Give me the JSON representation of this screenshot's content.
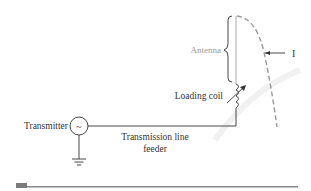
{
  "diagram": {
    "labels": {
      "antenna": "Antenna",
      "current": "I",
      "loading_coil": "Loading coil",
      "transmitter": "Transmitter",
      "transmission_line_1": "Transmission line",
      "transmission_line_2": "feeder",
      "source_symbol": "~"
    },
    "colors": {
      "line": "#333333",
      "antenna_label": "#999999",
      "antenna_wire": "#aaaaaa",
      "current_curve": "#999999",
      "bottom_bar": "#888888",
      "bottom_block": "#7a7a7a"
    }
  }
}
